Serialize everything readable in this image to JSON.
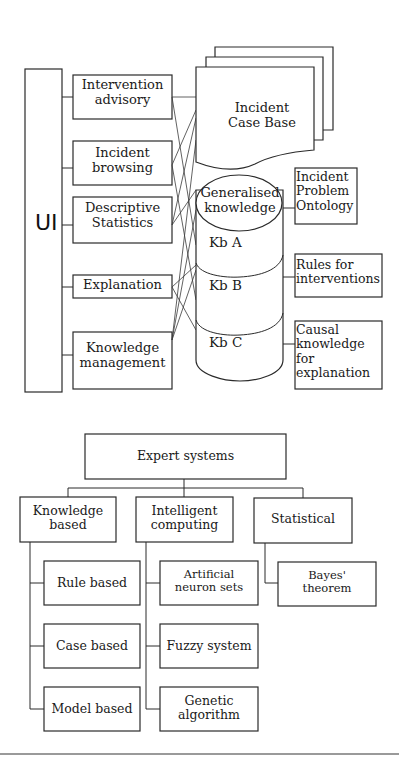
{
  "architecture": {
    "ui_label": "UI",
    "modules": [
      {
        "label": "Intervention advisory"
      },
      {
        "label": "Incident browsing"
      },
      {
        "label": "Descriptive Statistics"
      },
      {
        "label": "Explanation"
      },
      {
        "label": "Knowledge management"
      }
    ],
    "case_base": {
      "label": "Incident Case Base"
    },
    "knowledge_base": {
      "generalised": "Generalised knowledge",
      "segments": [
        "Kb A",
        "Kb B",
        "Kb C"
      ]
    },
    "side_boxes": [
      {
        "label": "Incident Problem Ontology"
      },
      {
        "label": "Rules for interventions"
      },
      {
        "label": "Causal knowledge for explanation"
      }
    ]
  },
  "taxonomy": {
    "root": "Expert systems",
    "categories": [
      {
        "label": "Knowledge based",
        "children": [
          "Rule based",
          "Case based",
          "Model based"
        ]
      },
      {
        "label": "Intelligent computing",
        "children": [
          "Artificial neuron sets",
          "Fuzzy system",
          "Genetic algorithm"
        ]
      },
      {
        "label": "Statistical",
        "children": [
          "Bayes' theorem"
        ]
      }
    ]
  }
}
